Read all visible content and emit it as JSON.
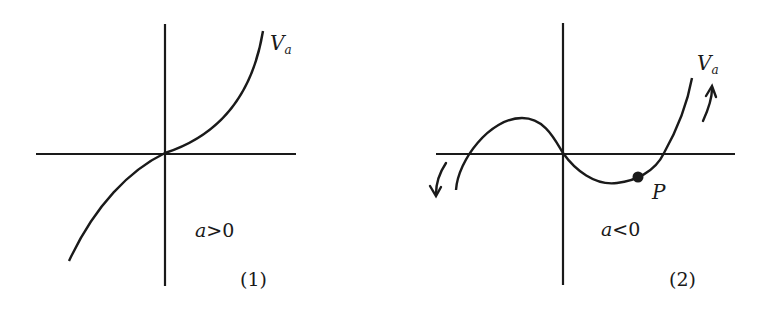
{
  "panels": [
    {
      "id": "1",
      "curve_label": "V",
      "curve_label_sub": "a",
      "condition_var": "a",
      "condition_rest": ">0",
      "caption": "(1)"
    },
    {
      "id": "2",
      "curve_label": "V",
      "curve_label_sub": "a",
      "condition_var": "a",
      "condition_rest": "<0",
      "point_label": "P",
      "caption": "(2)"
    }
  ],
  "colors": {
    "ink": "#1a1a1a",
    "background": "#ffffff"
  }
}
